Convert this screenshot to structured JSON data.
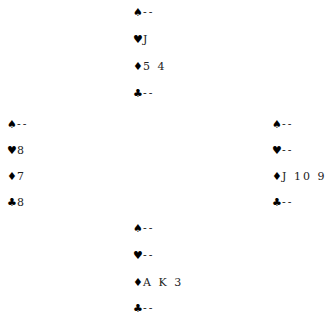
{
  "hands": {
    "north": {
      "spades": "--",
      "hearts": "J",
      "diamonds": "5 4",
      "clubs": "--"
    },
    "west": {
      "spades": "--",
      "hearts": "8",
      "diamonds": "7",
      "clubs": "8"
    },
    "east": {
      "spades": "--",
      "hearts": "--",
      "diamonds": "J 10 9",
      "clubs": "--"
    },
    "south": {
      "spades": "--",
      "hearts": "--",
      "diamonds": "A K 3",
      "clubs": "--"
    }
  },
  "suits": {
    "spades": "♠",
    "hearts": "♥",
    "diamonds": "♦",
    "clubs": "♣"
  }
}
